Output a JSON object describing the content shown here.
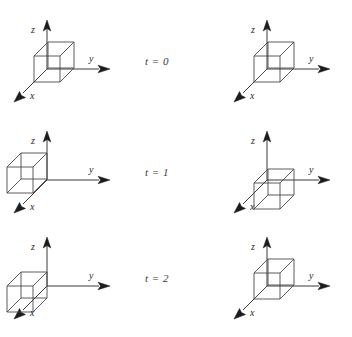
{
  "figure": {
    "type": "diagram",
    "background_color": "#ffffff",
    "axis_color": "#3a3a3a",
    "cube_color": "#4a4a4a",
    "label_color": "#2a2a2a"
  },
  "axis_labels": {
    "x": "x",
    "y": "y",
    "z": "z"
  },
  "time_labels": [
    {
      "text": "t = 0",
      "value": 0
    },
    {
      "text": "t = 1",
      "value": 1
    },
    {
      "text": "t = 2",
      "value": 2
    }
  ],
  "panels": [
    {
      "id": "left-t0",
      "column": "left",
      "time": 0,
      "origin": {
        "x": 47,
        "y": 69
      },
      "cube_offset": {
        "x": 0,
        "y": 0
      },
      "cube_size": 26,
      "depth": 14,
      "x_label": "x",
      "y_label": "y",
      "z_label": "z"
    },
    {
      "id": "right-t0",
      "column": "right",
      "time": 0,
      "origin": {
        "x": 267,
        "y": 69
      },
      "cube_offset": {
        "x": 0,
        "y": 0
      },
      "cube_size": 26,
      "depth": 14,
      "x_label": "x",
      "y_label": "y",
      "z_label": "z"
    },
    {
      "id": "left-t1",
      "column": "left",
      "time": 1,
      "origin": {
        "x": 47,
        "y": 180
      },
      "cube_offset": {
        "x": -27,
        "y": 0
      },
      "cube_size": 26,
      "depth": 14,
      "x_label": "x",
      "y_label": "y",
      "z_label": "z"
    },
    {
      "id": "right-t1",
      "column": "right",
      "time": 1,
      "origin": {
        "x": 267,
        "y": 180
      },
      "cube_offset": {
        "x": 0,
        "y": 27
      },
      "cube_size": 26,
      "depth": 14,
      "x_label": "x",
      "y_label": "y",
      "z_label": "z"
    },
    {
      "id": "left-t2",
      "column": "left",
      "time": 2,
      "origin": {
        "x": 47,
        "y": 286
      },
      "cube_offset": {
        "x": -27,
        "y": 14
      },
      "cube_size": 26,
      "depth": 14,
      "x_label": "x",
      "y_label": "y",
      "z_label": "z"
    },
    {
      "id": "right-t2",
      "column": "right",
      "time": 2,
      "origin": {
        "x": 267,
        "y": 286
      },
      "cube_offset": {
        "x": 0,
        "y": 0
      },
      "cube_size": 26,
      "depth": 14,
      "x_label": "x",
      "y_label": "y",
      "z_label": "z"
    }
  ],
  "time_label_positions": [
    {
      "left": 145,
      "top": 55
    },
    {
      "left": 145,
      "top": 166
    },
    {
      "left": 145,
      "top": 272
    }
  ]
}
